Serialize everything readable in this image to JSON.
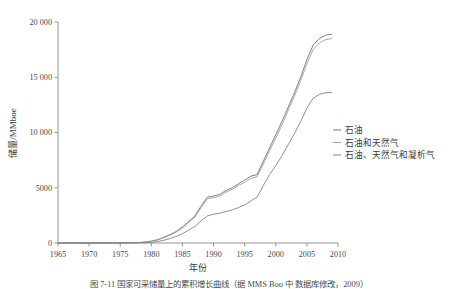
{
  "chart_data": {
    "type": "line",
    "title": "",
    "xlabel": "年份",
    "ylabel": "储量/MMboe",
    "xlim": [
      1965,
      2010
    ],
    "ylim": [
      0,
      20000
    ],
    "grid": false,
    "legend_position": "right",
    "xticks": [
      "1965",
      "1970",
      "1975",
      "1980",
      "1985",
      "1990",
      "1995",
      "2000",
      "2005",
      "2010"
    ],
    "yticks": [
      "0",
      "5000",
      "10 000",
      "15 000",
      "20 000"
    ],
    "x": [
      1965,
      1970,
      1975,
      1978,
      1979,
      1980,
      1981,
      1982,
      1983,
      1984,
      1985,
      1986,
      1987,
      1988,
      1989,
      1990,
      1991,
      1992,
      1993,
      1994,
      1995,
      1996,
      1997,
      1998,
      1999,
      2000,
      2001,
      2002,
      2003,
      2004,
      2005,
      2006,
      2007,
      2008,
      2009
    ],
    "series": [
      {
        "name": "石油",
        "color": "#6b6b6b",
        "values": [
          0,
          0,
          10,
          40,
          90,
          170,
          300,
          520,
          760,
          1050,
          1450,
          1950,
          2450,
          3350,
          4150,
          4250,
          4400,
          4750,
          5000,
          5350,
          5700,
          6050,
          6200,
          7400,
          8600,
          9800,
          11000,
          12300,
          13600,
          15000,
          16600,
          17900,
          18500,
          18800,
          18900
        ]
      },
      {
        "name": "石油和天然气",
        "color": "#9a9a9a",
        "values": [
          0,
          0,
          8,
          35,
          80,
          150,
          270,
          480,
          700,
          980,
          1360,
          1850,
          2330,
          3200,
          4000,
          4100,
          4250,
          4600,
          4850,
          5200,
          5500,
          5850,
          6000,
          7150,
          8350,
          9500,
          10700,
          12000,
          13300,
          14700,
          16200,
          17500,
          18100,
          18400,
          18500
        ]
      },
      {
        "name": "石油、天然气和凝析气",
        "color": "#7d7d7d",
        "values": [
          0,
          0,
          5,
          15,
          30,
          60,
          130,
          250,
          400,
          600,
          850,
          1150,
          1500,
          2000,
          2450,
          2600,
          2700,
          2850,
          3000,
          3200,
          3450,
          3800,
          4150,
          5200,
          6200,
          7000,
          7900,
          8900,
          9900,
          11000,
          12200,
          13100,
          13450,
          13600,
          13620
        ]
      }
    ],
    "legend": [
      {
        "label": "石油",
        "color": "#6b6b6b"
      },
      {
        "label": "石油和天然气",
        "color": "#9a9a9a"
      },
      {
        "label": "石油、天然气和凝析气",
        "color": "#7d7d7d"
      }
    ]
  },
  "caption": {
    "text": "图 7-11   国家可采储量上的累积增长曲线（据 MMS Boo 中  数据库修改，2009）"
  }
}
